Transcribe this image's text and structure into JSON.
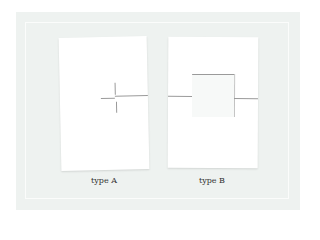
{
  "figure": {
    "items": [
      {
        "label": "type A",
        "description": "sheet with cross-shaped cut"
      },
      {
        "label": "type B",
        "description": "sheet with square flap cut"
      }
    ],
    "colors": {
      "background": "#eef2f0",
      "paper": "#ffffff",
      "cut_line": "#9a9a9a"
    }
  }
}
